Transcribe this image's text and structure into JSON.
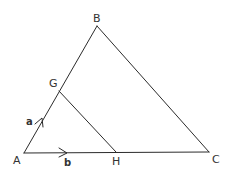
{
  "diagram": {
    "stroke_color": "#2b2b2b",
    "points": {
      "A": {
        "label": "A"
      },
      "B": {
        "label": "B"
      },
      "C": {
        "label": "C"
      },
      "G": {
        "label": "G"
      },
      "H": {
        "label": "H"
      }
    },
    "vectors": {
      "a": {
        "label": "a",
        "along": "AG"
      },
      "b": {
        "label": "b",
        "along": "AH"
      }
    },
    "segments": [
      "AB",
      "BC",
      "AC",
      "GH"
    ]
  }
}
